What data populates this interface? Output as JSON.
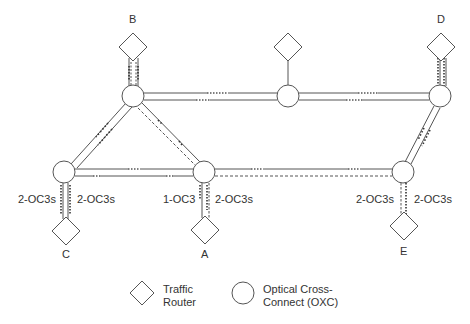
{
  "diagram": {
    "type": "network-topology",
    "colors": {
      "stroke": "#555555",
      "text": "#333333",
      "background": "#ffffff"
    },
    "nodes": {
      "oxc": [
        {
          "id": "oxc-b",
          "x": 133,
          "y": 96
        },
        {
          "id": "oxc-mid",
          "x": 288,
          "y": 96
        },
        {
          "id": "oxc-d",
          "x": 440,
          "y": 96
        },
        {
          "id": "oxc-c",
          "x": 64,
          "y": 172
        },
        {
          "id": "oxc-a",
          "x": 204,
          "y": 172
        },
        {
          "id": "oxc-e",
          "x": 403,
          "y": 172
        }
      ],
      "routers": [
        {
          "id": "B",
          "label": "B",
          "x": 133,
          "y": 46
        },
        {
          "id": "mid",
          "label": "",
          "x": 288,
          "y": 46
        },
        {
          "id": "D",
          "label": "D",
          "x": 441,
          "y": 46
        },
        {
          "id": "C",
          "label": "C",
          "x": 66,
          "y": 231
        },
        {
          "id": "A",
          "label": "A",
          "x": 205,
          "y": 230
        },
        {
          "id": "E",
          "label": "E",
          "x": 404,
          "y": 226
        }
      ]
    },
    "router_labels": {
      "B": "B",
      "D": "D",
      "C": "C",
      "A": "A",
      "E": "E"
    },
    "link_labels": {
      "c_left": "2-OC3s",
      "c_right": "2-OC3s",
      "a_left": "1-OC3",
      "a_right": "2-OC3s",
      "e_left": "2-OC3s",
      "e_right": "2-OC3s"
    },
    "legend": {
      "router_line1": "Traffic",
      "router_line2": "Router",
      "oxc_line1": "Optical Cross-",
      "oxc_line2": "Connect (OXC)"
    }
  }
}
